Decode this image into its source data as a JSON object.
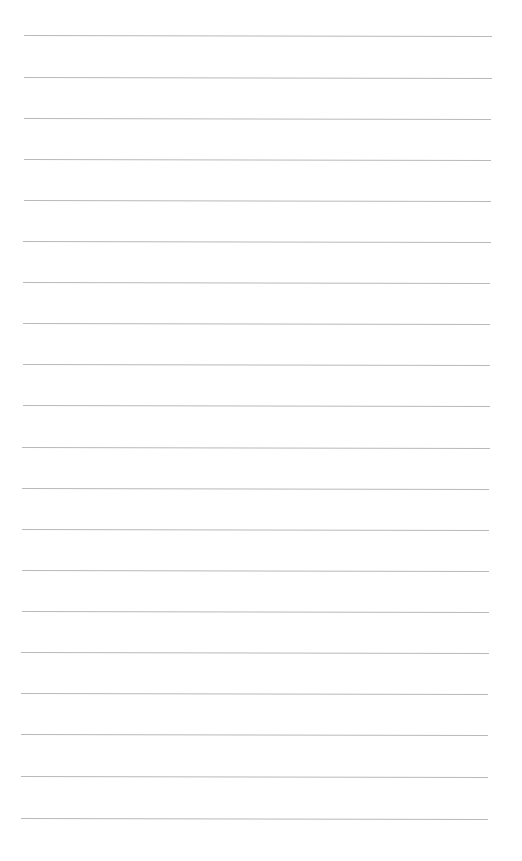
{
  "page": {
    "type": "ruled-sheet",
    "background": "#ffffff",
    "rule_color": "#b9b9b9",
    "rule_count": 20,
    "rules": [
      {
        "y": 35,
        "x1": 24,
        "x2": 492
      },
      {
        "y": 77,
        "x1": 24,
        "x2": 492
      },
      {
        "y": 118,
        "x1": 24,
        "x2": 491
      },
      {
        "y": 159,
        "x1": 24,
        "x2": 491
      },
      {
        "y": 200,
        "x1": 24,
        "x2": 491
      },
      {
        "y": 241,
        "x1": 23,
        "x2": 491
      },
      {
        "y": 282,
        "x1": 23,
        "x2": 490
      },
      {
        "y": 323,
        "x1": 23,
        "x2": 490
      },
      {
        "y": 364,
        "x1": 23,
        "x2": 490
      },
      {
        "y": 405,
        "x1": 23,
        "x2": 490
      },
      {
        "y": 447,
        "x1": 22,
        "x2": 490
      },
      {
        "y": 488,
        "x1": 22,
        "x2": 489
      },
      {
        "y": 529,
        "x1": 22,
        "x2": 489
      },
      {
        "y": 570,
        "x1": 22,
        "x2": 489
      },
      {
        "y": 611,
        "x1": 22,
        "x2": 489
      },
      {
        "y": 652,
        "x1": 21,
        "x2": 489
      },
      {
        "y": 693,
        "x1": 21,
        "x2": 488
      },
      {
        "y": 734,
        "x1": 21,
        "x2": 488
      },
      {
        "y": 776,
        "x1": 21,
        "x2": 488
      },
      {
        "y": 818,
        "x1": 21,
        "x2": 488
      }
    ]
  }
}
